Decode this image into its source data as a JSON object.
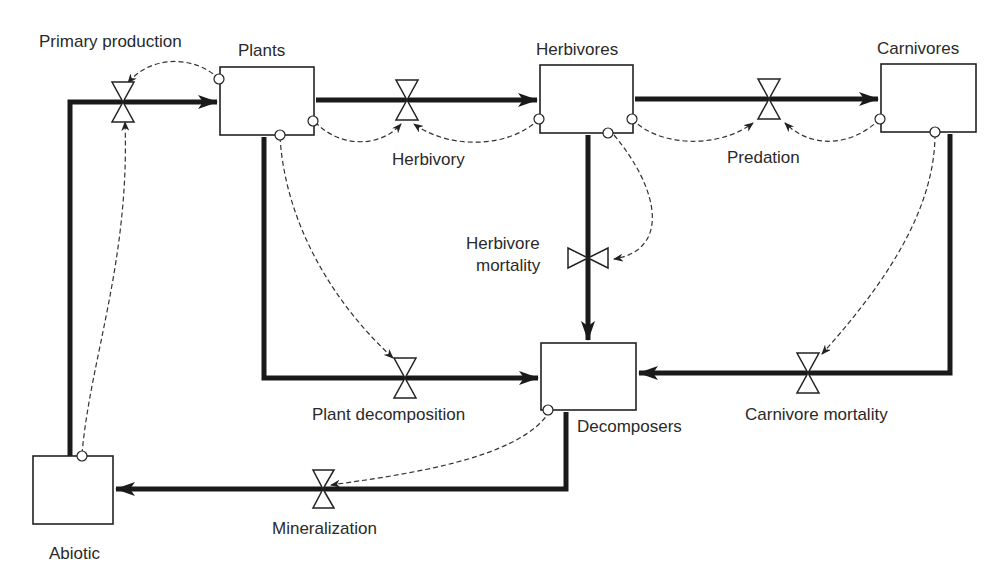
{
  "diagram": {
    "type": "stock-and-flow",
    "stocks": [
      {
        "id": "plants",
        "label": "Plants"
      },
      {
        "id": "herbivores",
        "label": "Herbivores"
      },
      {
        "id": "carnivores",
        "label": "Carnivores"
      },
      {
        "id": "decomposers",
        "label": "Decomposers"
      },
      {
        "id": "abiotic",
        "label": "Abiotic"
      }
    ],
    "flows": [
      {
        "id": "primary_production",
        "label": "Primary production",
        "from": "abiotic",
        "to": "plants"
      },
      {
        "id": "herbivory",
        "label": "Herbivory",
        "from": "plants",
        "to": "herbivores"
      },
      {
        "id": "predation",
        "label": "Predation",
        "from": "herbivores",
        "to": "carnivores"
      },
      {
        "id": "herbivore_mortality",
        "label_line1": "Herbivore",
        "label_line2": "mortality",
        "from": "herbivores",
        "to": "decomposers"
      },
      {
        "id": "plant_decomposition",
        "label": "Plant decomposition",
        "from": "plants",
        "to": "decomposers"
      },
      {
        "id": "carnivore_mortality",
        "label": "Carnivore mortality",
        "from": "carnivores",
        "to": "decomposers"
      },
      {
        "id": "mineralization",
        "label": "Mineralization",
        "from": "decomposers",
        "to": "abiotic"
      }
    ],
    "info_links": [
      {
        "from": "plants",
        "to": "primary_production"
      },
      {
        "from": "abiotic",
        "to": "primary_production"
      },
      {
        "from": "plants",
        "to": "herbivory"
      },
      {
        "from": "herbivores",
        "to": "herbivory"
      },
      {
        "from": "herbivores",
        "to": "predation"
      },
      {
        "from": "carnivores",
        "to": "predation"
      },
      {
        "from": "herbivores",
        "to": "herbivore_mortality"
      },
      {
        "from": "plants",
        "to": "plant_decomposition"
      },
      {
        "from": "carnivores",
        "to": "carnivore_mortality"
      },
      {
        "from": "decomposers",
        "to": "mineralization"
      }
    ]
  }
}
